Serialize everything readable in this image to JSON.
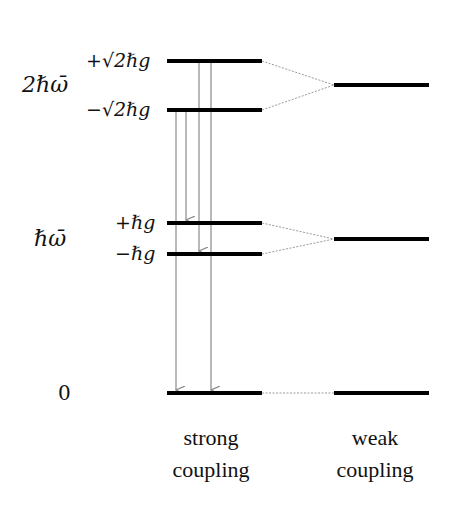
{
  "diagram": {
    "energy_labels": [
      {
        "text": "2ℏω̄",
        "y": 85
      },
      {
        "text": "ℏω̄",
        "y": 239
      },
      {
        "text": "0",
        "y": 393
      }
    ],
    "strong_level_labels": [
      {
        "text": "+√2ℏg",
        "y": 61
      },
      {
        "text": "−√2ℏg",
        "y": 110
      },
      {
        "text": "+ℏg",
        "y": 223
      },
      {
        "text": "−ℏg",
        "y": 254
      }
    ],
    "strong_levels_y": [
      61,
      110,
      223,
      254,
      393
    ],
    "weak_levels_y": [
      85,
      239,
      393
    ],
    "captions": {
      "strong": [
        "strong",
        "coupling"
      ],
      "weak": [
        "weak",
        "coupling"
      ]
    },
    "transitions": [
      {
        "from": "−√2ℏg",
        "to": "0"
      },
      {
        "from": "−√2ℏg",
        "to": "+ℏg"
      },
      {
        "from": "+√2ℏg",
        "to": "−ℏg"
      },
      {
        "from": "+√2ℏg",
        "to": "0"
      }
    ],
    "colors": {
      "level": "#000000",
      "arrow": "#8a8a8a",
      "connector": "#9a9a9a"
    }
  }
}
